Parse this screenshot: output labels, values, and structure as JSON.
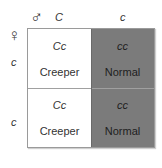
{
  "header": {
    "male_symbol": "♂",
    "female_symbol": "♀",
    "male_alleles": [
      "C",
      "c"
    ],
    "female_alleles": [
      "c",
      "c"
    ]
  },
  "cells": [
    {
      "genotype": "Cc",
      "phenotype": "Creeper",
      "shade": "light"
    },
    {
      "genotype": "cc",
      "phenotype": "Normal",
      "shade": "dark"
    },
    {
      "genotype": "Cc",
      "phenotype": "Creeper",
      "shade": "light"
    },
    {
      "genotype": "cc",
      "phenotype": "Normal",
      "shade": "dark"
    }
  ],
  "colors": {
    "light": "#ffffff",
    "dark": "#7b7b7b",
    "border": "#9a9a9a"
  }
}
